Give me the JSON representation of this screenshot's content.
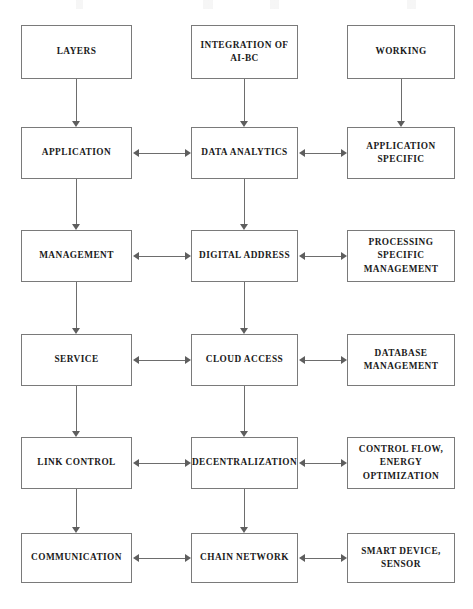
{
  "diagram": {
    "type": "flowchart",
    "title": "",
    "background_color": "#ffffff",
    "box_border_color": "#7a7a7a",
    "arrow_color": "#5e5e5e",
    "text_color": "#1a1a1a",
    "columns": 3,
    "rows": 6,
    "column_headers": [
      "LAYERS",
      "INTEGRATION OF AI-BC",
      "WORKING"
    ],
    "nodes": [
      {
        "id": "r1c1",
        "row": 1,
        "col": 1,
        "lines": [
          "LAYERS"
        ]
      },
      {
        "id": "r1c2",
        "row": 1,
        "col": 2,
        "lines": [
          "INTEGRATION OF",
          "AI-BC"
        ]
      },
      {
        "id": "r1c3",
        "row": 1,
        "col": 3,
        "lines": [
          "WORKING"
        ]
      },
      {
        "id": "r2c1",
        "row": 2,
        "col": 1,
        "lines": [
          "APPLICATION"
        ]
      },
      {
        "id": "r2c2",
        "row": 2,
        "col": 2,
        "lines": [
          "DATA ANALYTICS"
        ]
      },
      {
        "id": "r2c3",
        "row": 2,
        "col": 3,
        "lines": [
          "APPLICATION",
          "SPECIFIC"
        ]
      },
      {
        "id": "r3c1",
        "row": 3,
        "col": 1,
        "lines": [
          "MANAGEMENT"
        ]
      },
      {
        "id": "r3c2",
        "row": 3,
        "col": 2,
        "lines": [
          "DIGITAL ADDRESS"
        ]
      },
      {
        "id": "r3c3",
        "row": 3,
        "col": 3,
        "lines": [
          "PROCESSING",
          "SPECIFIC",
          "MANAGEMENT"
        ]
      },
      {
        "id": "r4c1",
        "row": 4,
        "col": 1,
        "lines": [
          "SERVICE"
        ]
      },
      {
        "id": "r4c2",
        "row": 4,
        "col": 2,
        "lines": [
          "CLOUD ACCESS"
        ]
      },
      {
        "id": "r4c3",
        "row": 4,
        "col": 3,
        "lines": [
          "DATABASE",
          "MANAGEMENT"
        ]
      },
      {
        "id": "r5c1",
        "row": 5,
        "col": 1,
        "lines": [
          "LINK CONTROL"
        ]
      },
      {
        "id": "r5c2",
        "row": 5,
        "col": 2,
        "lines": [
          "DECENTRALIZATION"
        ]
      },
      {
        "id": "r5c3",
        "row": 5,
        "col": 3,
        "lines": [
          "CONTROL FLOW,",
          "ENERGY",
          "OPTIMIZATION"
        ]
      },
      {
        "id": "r6c1",
        "row": 6,
        "col": 1,
        "lines": [
          "COMMUNICATION"
        ]
      },
      {
        "id": "r6c2",
        "row": 6,
        "col": 2,
        "lines": [
          "CHAIN NETWORK"
        ]
      },
      {
        "id": "r6c3",
        "row": 6,
        "col": 3,
        "lines": [
          "SMART DEVICE,",
          "SENSOR"
        ]
      }
    ],
    "edges": [
      {
        "from": "r1c1",
        "to": "r2c1",
        "direction": "down"
      },
      {
        "from": "r2c1",
        "to": "r3c1",
        "direction": "down"
      },
      {
        "from": "r3c1",
        "to": "r4c1",
        "direction": "down"
      },
      {
        "from": "r4c1",
        "to": "r5c1",
        "direction": "down"
      },
      {
        "from": "r5c1",
        "to": "r6c1",
        "direction": "down"
      },
      {
        "from": "r1c2",
        "to": "r2c2",
        "direction": "down"
      },
      {
        "from": "r2c2",
        "to": "r3c2",
        "direction": "down"
      },
      {
        "from": "r3c2",
        "to": "r4c2",
        "direction": "down"
      },
      {
        "from": "r4c2",
        "to": "r5c2",
        "direction": "down"
      },
      {
        "from": "r5c2",
        "to": "r6c2",
        "direction": "down"
      },
      {
        "from": "r1c3",
        "to": "r2c3",
        "direction": "down"
      },
      {
        "from": "r2c1",
        "to": "r2c2",
        "direction": "both"
      },
      {
        "from": "r2c2",
        "to": "r2c3",
        "direction": "both"
      },
      {
        "from": "r3c1",
        "to": "r3c2",
        "direction": "both"
      },
      {
        "from": "r3c2",
        "to": "r3c3",
        "direction": "both"
      },
      {
        "from": "r4c1",
        "to": "r4c2",
        "direction": "both"
      },
      {
        "from": "r4c2",
        "to": "r4c3",
        "direction": "both"
      },
      {
        "from": "r5c1",
        "to": "r5c2",
        "direction": "both"
      },
      {
        "from": "r5c2",
        "to": "r5c3",
        "direction": "both"
      },
      {
        "from": "r6c1",
        "to": "r6c2",
        "direction": "both"
      },
      {
        "from": "r6c2",
        "to": "r6c3",
        "direction": "both"
      }
    ]
  },
  "layout": {
    "columns_x": [
      {
        "left": 21,
        "width": 111
      },
      {
        "left": 191,
        "width": 107
      },
      {
        "left": 347,
        "width": 108
      }
    ],
    "rows_y": [
      {
        "top": 25,
        "height": 54
      },
      {
        "top": 127,
        "height": 52
      },
      {
        "top": 230,
        "height": 52
      },
      {
        "top": 334,
        "height": 52
      },
      {
        "top": 437,
        "height": 52
      },
      {
        "top": 533,
        "height": 50
      }
    ]
  }
}
